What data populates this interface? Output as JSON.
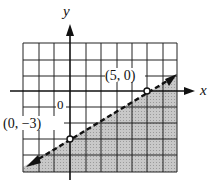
{
  "graph": {
    "x_axis_label": "x",
    "y_axis_label": "y",
    "origin_label": "0",
    "points": [
      {
        "label": "(5, 0)",
        "x": 5,
        "y": 0
      },
      {
        "label": "(0, −3)",
        "x": 0,
        "y": -3
      }
    ],
    "boundary_line": {
      "equation": "y = 3/5 x - 3",
      "style": "dashed"
    },
    "shaded_region": "below line",
    "grid": {
      "x_min": -3,
      "x_max": 7,
      "y_min": -5,
      "y_max": 3
    },
    "colors": {
      "shade": "#c4c4c4",
      "grid": "#222222",
      "line": "#111111"
    }
  }
}
